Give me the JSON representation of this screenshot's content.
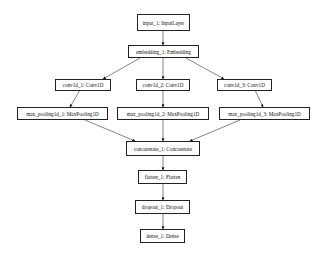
{
  "diagram": {
    "type": "keras-model-graph",
    "nodes": [
      {
        "id": "input_1",
        "label": "input_1: InputLayer"
      },
      {
        "id": "embedding_1",
        "label": "embedding_1: Embedding"
      },
      {
        "id": "conv1d_1",
        "label": "conv1d_1: Conv1D"
      },
      {
        "id": "conv1d_2",
        "label": "conv1d_2: Conv1D"
      },
      {
        "id": "conv1d_3",
        "label": "conv1d_3: Conv1D"
      },
      {
        "id": "max_pooling1d_1",
        "label": "max_pooling1d_1: MaxPooling1D"
      },
      {
        "id": "max_pooling1d_2",
        "label": "max_pooling1d_2: MaxPooling1D"
      },
      {
        "id": "max_pooling1d_3",
        "label": "max_pooling1d_3: MaxPooling1D"
      },
      {
        "id": "concatenate_1",
        "label": "concatenate_1: Concatenate"
      },
      {
        "id": "flatten_1",
        "label": "flatten_1: Flatten"
      },
      {
        "id": "dropout_1",
        "label": "dropout_1: Dropout"
      },
      {
        "id": "dense_1",
        "label": "dense_1: Dense"
      }
    ],
    "edges": [
      [
        "input_1",
        "embedding_1"
      ],
      [
        "embedding_1",
        "conv1d_1"
      ],
      [
        "embedding_1",
        "conv1d_2"
      ],
      [
        "embedding_1",
        "conv1d_3"
      ],
      [
        "conv1d_1",
        "max_pooling1d_1"
      ],
      [
        "conv1d_2",
        "max_pooling1d_2"
      ],
      [
        "conv1d_3",
        "max_pooling1d_3"
      ],
      [
        "max_pooling1d_1",
        "concatenate_1"
      ],
      [
        "max_pooling1d_2",
        "concatenate_1"
      ],
      [
        "max_pooling1d_3",
        "concatenate_1"
      ],
      [
        "concatenate_1",
        "flatten_1"
      ],
      [
        "flatten_1",
        "dropout_1"
      ],
      [
        "dropout_1",
        "dense_1"
      ]
    ]
  }
}
